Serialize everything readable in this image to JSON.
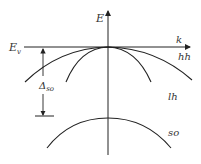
{
  "diagram": {
    "axis_labels": {
      "energy": "E",
      "wavevector": "k"
    },
    "level_label": {
      "main": "E",
      "sub": "v"
    },
    "bands": [
      {
        "id": "hh",
        "label": "hh",
        "name": "heavy hole"
      },
      {
        "id": "lh",
        "label": "lh",
        "name": "light hole"
      },
      {
        "id": "so",
        "label": "so",
        "name": "split-off"
      }
    ],
    "splitting": {
      "main": "Δ",
      "sub": "so"
    },
    "colors": {
      "line": "#222222",
      "text": "#333333",
      "background": "#ffffff"
    }
  }
}
